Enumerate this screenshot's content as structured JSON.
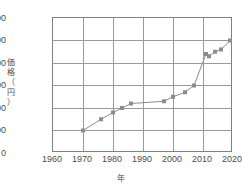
{
  "chart_data": {
    "type": "line",
    "title": "",
    "xlabel": "年",
    "ylabel": "価格（円）",
    "ylabel_chars": [
      "価",
      "格",
      "（",
      "円",
      "）"
    ],
    "xlim": [
      1960,
      2020
    ],
    "ylim": [
      0,
      600
    ],
    "grid": true,
    "legend": "none",
    "xticks": [
      1960,
      1970,
      1980,
      1990,
      2000,
      2010,
      2020
    ],
    "yticks": [
      0,
      100,
      200,
      300,
      400,
      500,
      600
    ],
    "series": [
      {
        "name": "価格",
        "color": "#8c8c8c",
        "marker": "square",
        "x": [
          1970,
          1976,
          1980,
          1983,
          1986,
          1997,
          2000,
          2004,
          2007,
          2011,
          2012,
          2014,
          2016,
          2019
        ],
        "y": [
          100,
          150,
          180,
          200,
          220,
          230,
          250,
          270,
          300,
          440,
          430,
          450,
          460,
          500
        ]
      }
    ]
  },
  "axes": {
    "x_tick_labels": [
      "1960",
      "1970",
      "1980",
      "1990",
      "2000",
      "2010",
      "2020"
    ],
    "y_tick_labels": [
      "0",
      "100",
      "200",
      "300",
      "400",
      "500",
      "600"
    ],
    "x_axis_title": "年",
    "y_axis_title": "価格（円）"
  }
}
